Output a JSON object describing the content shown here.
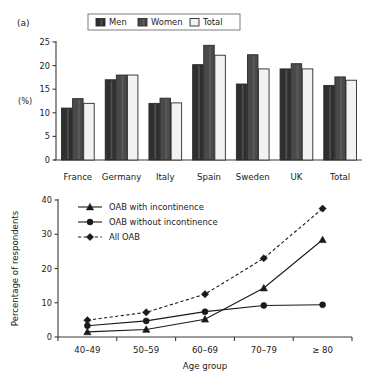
{
  "figure": {
    "panel_a_label": "(a)",
    "panel_b_label": "(b)"
  },
  "chart_data": [
    {
      "type": "bar",
      "panel": "(a)",
      "title": "",
      "xlabel": "",
      "ylabel": "(%)",
      "ylim": [
        0,
        25
      ],
      "yticks": [
        0,
        5,
        10,
        15,
        20,
        25
      ],
      "ytick_labels": [
        "0",
        "5",
        "10",
        "15",
        "20",
        "25"
      ],
      "grid": false,
      "legend_position": "top-center",
      "categories": [
        "France",
        "Germany",
        "Italy",
        "Spain",
        "Sweden",
        "UK",
        "Total"
      ],
      "series": [
        {
          "name": "Men",
          "color": "#2f2f2f",
          "values": [
            11.0,
            17.0,
            12.0,
            20.2,
            16.1,
            19.3,
            15.8
          ]
        },
        {
          "name": "Women",
          "color": "#4a4a4a",
          "values": [
            13.0,
            18.0,
            13.1,
            24.3,
            22.3,
            20.4,
            17.6
          ]
        },
        {
          "name": "Total",
          "color": "#f2f2f2",
          "values": [
            12.0,
            18.0,
            12.1,
            22.2,
            19.3,
            19.3,
            16.9
          ]
        }
      ]
    },
    {
      "type": "line",
      "panel": "(b)",
      "title": "",
      "xlabel": "Age group",
      "ylabel": "Percentage of respondents",
      "ylim": [
        0,
        40
      ],
      "yticks": [
        0,
        10,
        20,
        30,
        40
      ],
      "ytick_labels": [
        "0",
        "10",
        "20",
        "30",
        "40"
      ],
      "grid": false,
      "legend_position": "top-left",
      "x": [
        "40–49",
        "50–59",
        "60–69",
        "70–79",
        "≥ 80"
      ],
      "series": [
        {
          "name": "OAB with incontinence",
          "marker": "triangle",
          "linestyle": "solid",
          "color": "#1a1a1a",
          "values": [
            1.5,
            2.2,
            5.2,
            14.3,
            28.4
          ]
        },
        {
          "name": "OAB without incontinence",
          "marker": "circle",
          "linestyle": "solid",
          "color": "#1a1a1a",
          "values": [
            3.3,
            4.7,
            7.4,
            9.2,
            9.4
          ]
        },
        {
          "name": "All OAB",
          "marker": "diamond",
          "linestyle": "dashed",
          "color": "#1a1a1a",
          "values": [
            4.9,
            7.2,
            12.5,
            23.0,
            37.5
          ]
        }
      ]
    }
  ]
}
